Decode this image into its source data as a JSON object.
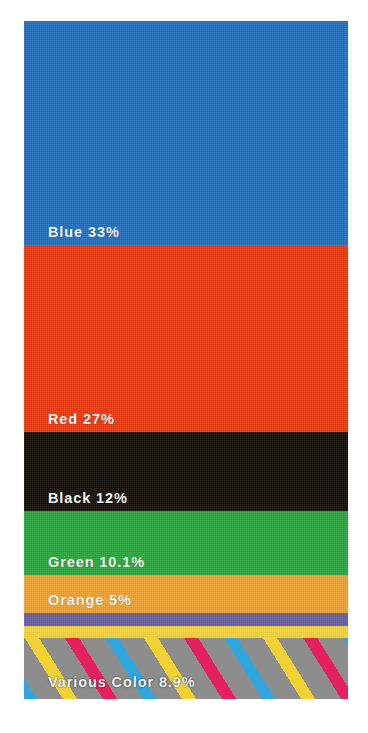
{
  "chart_data": {
    "type": "bar",
    "orientation": "vertical-stacked",
    "title": "",
    "subtitle": "",
    "xlabel": "",
    "ylabel": "",
    "legend_position": "inline-on-segment",
    "grid": false,
    "units": "%",
    "total": 96.0,
    "categories": [
      "Blue",
      "Red",
      "Black",
      "Green",
      "Orange",
      "Purple",
      "Yellow",
      "Various Color"
    ],
    "values": [
      33,
      27,
      12,
      10.1,
      5,
      2,
      2,
      8.9
    ],
    "labels": [
      "Blue 33%",
      "Red 27%",
      "Black 12%",
      "Green 10.1%",
      "Orange 5%",
      "",
      "",
      "Various Color 8.9%"
    ],
    "colors": [
      "#2272bf",
      "#ee3a11",
      "#151009",
      "#2ba83e",
      "#f0a332",
      "#6a5fa0",
      "#f4d43c",
      "#8d8d8d"
    ],
    "ylim": [
      0,
      100
    ]
  },
  "background_color": "#ffffff",
  "label_color": "#f2f3f2",
  "chart": {
    "segments": [
      {
        "name": "blue",
        "label": "Blue 33%",
        "value": 33,
        "color": "#2272bf",
        "height_px": 224,
        "has_label": true
      },
      {
        "name": "red",
        "label": "Red 27%",
        "value": 27,
        "color": "#ee3a11",
        "height_px": 187,
        "has_label": true
      },
      {
        "name": "black",
        "label": "Black 12%",
        "value": 12,
        "color": "#151009",
        "height_px": 79,
        "has_label": true
      },
      {
        "name": "green",
        "label": "Green 10.1%",
        "value": 10.1,
        "color": "#2ba83e",
        "height_px": 64,
        "has_label": true
      },
      {
        "name": "orange",
        "label": "Orange 5%",
        "value": 5,
        "color": "#f0a332",
        "height_px": 38,
        "has_label": true
      },
      {
        "name": "purple",
        "label": "",
        "value": 2,
        "color": "#6a5fa0",
        "height_px": 13,
        "has_label": false
      },
      {
        "name": "yellow",
        "label": "",
        "value": 2,
        "color": "#f4d43c",
        "height_px": 12,
        "has_label": false
      },
      {
        "name": "various-color",
        "label": "Various Color 8.9%",
        "value": 8.9,
        "color": "#8d8d8d",
        "stripe_colors": [
          "#2fa6e0",
          "#f2d232",
          "#e5205e"
        ],
        "height_px": 61,
        "has_label": true
      }
    ]
  }
}
